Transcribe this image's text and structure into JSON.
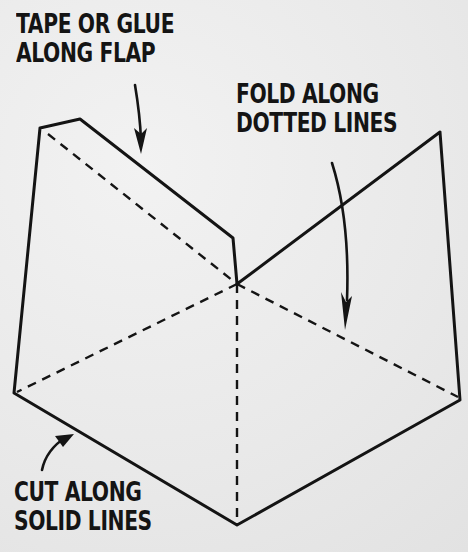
{
  "labels": {
    "tape": {
      "line1": "TAPE OR GLUE",
      "line2": "ALONG FLAP"
    },
    "fold": {
      "line1": "FOLD ALONG",
      "line2": "DOTTED LINES"
    },
    "cut": {
      "line1": "CUT ALONG",
      "line2": "SOLID LINES"
    }
  },
  "colors": {
    "ink": "#141414",
    "paper": "#ececec"
  },
  "diagram": {
    "solid_outline": [
      [
        40,
        128
      ],
      [
        80,
        119
      ],
      [
        233,
        238
      ],
      [
        237,
        284
      ],
      [
        440,
        132
      ],
      [
        460,
        400
      ],
      [
        237,
        525
      ],
      [
        14,
        393
      ]
    ],
    "dotted_lines": [
      [
        [
          48,
          134
        ],
        [
          237,
          284
        ]
      ],
      [
        [
          237,
          284
        ],
        [
          17,
          392
        ]
      ],
      [
        [
          237,
          284
        ],
        [
          237,
          522
        ]
      ],
      [
        [
          237,
          284
        ],
        [
          458,
          397
        ]
      ]
    ],
    "arrows": [
      "tape-arrow",
      "fold-arrow",
      "cut-arrow"
    ]
  }
}
